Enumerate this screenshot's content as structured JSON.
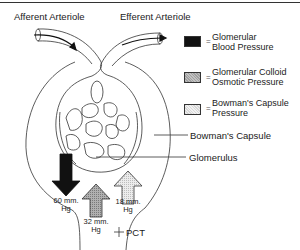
{
  "labels": {
    "afferent": "Afferent Arteriole",
    "efferent": "Efferent Arteriole",
    "bowmans_capsule": "Bowman's Capsule",
    "glomerulus": "Glomerulus",
    "pct": "PCT"
  },
  "legend": {
    "items": [
      {
        "line1": "Glomerular",
        "line2": "Blood Pressure",
        "fill": "#111111",
        "pattern": "solid"
      },
      {
        "line1": "Glomerular Colloid",
        "line2": "Osmotic Pressure",
        "fill": "#a8a8a8",
        "pattern": "dotted-dark"
      },
      {
        "line1": "Bowman's Capsule",
        "line2": "Pressure",
        "fill": "#e4e4e4",
        "pattern": "dotted-light"
      }
    ],
    "separator": "="
  },
  "pressures": {
    "blood": {
      "value": "60 mm.",
      "unit": "Hg",
      "direction": "down"
    },
    "colloid": {
      "value": "32 mm.",
      "unit": "Hg",
      "direction": "up"
    },
    "capsule": {
      "value": "18 mm.",
      "unit": "Hg",
      "direction": "up"
    }
  }
}
